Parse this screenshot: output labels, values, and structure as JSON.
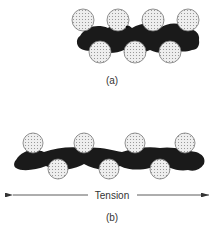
{
  "diagram": {
    "panels": [
      {
        "id": "a",
        "label": "(a)",
        "description": "Particles packed around a compact, tightly kinked chain",
        "top_particles": 4,
        "bottom_particles": 3
      },
      {
        "id": "b",
        "label": "(b)",
        "description": "Chain stretched under tension with particles spread apart",
        "top_particles": 4,
        "bottom_particles": 3,
        "arrow_label": "Tension"
      }
    ],
    "colors": {
      "chain": "#1a1a1a",
      "particle_fill": "#e6e6e6",
      "particle_stroke": "#777777",
      "particle_dots": "#888888",
      "arrow": "#333333"
    }
  }
}
